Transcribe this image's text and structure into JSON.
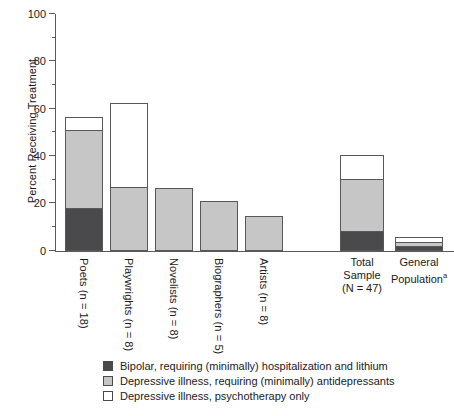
{
  "chart_data": {
    "type": "bar",
    "title": "",
    "xlabel": "",
    "ylabel": "Percent Receiving Treatment",
    "ylim": [
      0,
      100
    ],
    "ytick_labels": [
      "0",
      "20",
      "40",
      "60",
      "80",
      "100"
    ],
    "ytick_values": [
      0,
      20,
      40,
      60,
      80,
      100
    ],
    "minor_tick_values": [
      10,
      30,
      50,
      70,
      90
    ],
    "grid": false,
    "legend_position": "bottom",
    "stacked": true,
    "categories": [
      "Poets (n = 18)",
      "Playwrights (n = 8)",
      "Novelists (n = 8)",
      "Biographers (n = 5)",
      "Artists (n = 8)",
      "Total Sample (N = 47)",
      "General Population"
    ],
    "series": [
      {
        "name": "Bipolar, requiring (minimally) hospitalization and lithium",
        "color": "#4a4a4c",
        "values": [
          17.2,
          0,
          0,
          0,
          0,
          7.5,
          1.0
        ]
      },
      {
        "name": "Depressive illness, requiring (minimally) antidepressants",
        "color": "#c6c6c6",
        "values": [
          33.0,
          26.0,
          25.5,
          20.0,
          14.0,
          22.0,
          2.0
        ]
      },
      {
        "name": "Depressive illness, psychotherapy only",
        "color": "#ffffff",
        "values": [
          5.3,
          35.5,
          0,
          0,
          0,
          10.0,
          2.0
        ]
      }
    ],
    "totals": [
      55.5,
      61.5,
      25.5,
      20.0,
      14.0,
      39.5,
      5.0
    ]
  },
  "axis": {
    "y_label": "Percent Receiving Treatment",
    "ticks": [
      {
        "label": "100",
        "value": 100
      },
      {
        "label": "80",
        "value": 80
      },
      {
        "label": "60",
        "value": 60
      },
      {
        "label": "40",
        "value": 40
      },
      {
        "label": "20",
        "value": 20
      },
      {
        "label": "0",
        "value": 0
      }
    ]
  },
  "categories_vertical": [
    {
      "label": "Poets (n = 18)"
    },
    {
      "label": "Playwrights (n = 8)"
    },
    {
      "label": "Novelists (n = 8)"
    },
    {
      "label": "Biographers (n = 5)"
    },
    {
      "label": "Artists (n = 8)"
    }
  ],
  "categories_horizontal": [
    {
      "line1": "Total",
      "line2": "Sample",
      "line3": "(N = 47)"
    },
    {
      "line1": "General",
      "line2": "Population",
      "line3": ""
    }
  ],
  "general_population_footnote": "a",
  "legend": {
    "items": [
      {
        "swatch": "dark",
        "label": "Bipolar, requiring (minimally) hospitalization and lithium"
      },
      {
        "swatch": "grey",
        "label": "Depressive illness, requiring (minimally) antidepressants"
      },
      {
        "swatch": "white",
        "label": "Depressive illness, psychotherapy only"
      }
    ]
  }
}
